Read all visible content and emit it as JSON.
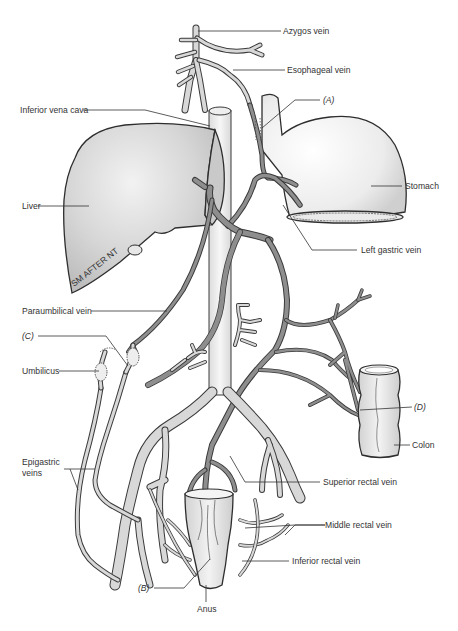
{
  "diagram": {
    "labels": {
      "azygos_vein": "Azygos vein",
      "esophageal_vein": "Esophageal vein",
      "inferior_vena_cava": "Inferior vena cava",
      "a": "(A)",
      "liver": "Liver",
      "stomach": "Stomach",
      "left_gastric_vein": "Left gastric vein",
      "paraumbilical_vein": "Paraumbilical vein",
      "c": "(C)",
      "umbilicus": "Umbilicus",
      "d": "(D)",
      "colon": "Colon",
      "epigastric_veins_line1": "Epigastric",
      "epigastric_veins_line2": "veins",
      "superior_rectal_vein": "Superior rectal vein",
      "middle_rectal_vein": "Middle rectal vein",
      "inferior_rectal_vein": "Inferior rectal vein",
      "b": "(B)",
      "anus": "Anus",
      "artist_signature": "SM AFTER NT"
    },
    "colors": {
      "portal_vein": "#8e8e8e",
      "systemic_vein": "#d8d8d8",
      "organ_fill": "#e6e6e6",
      "outline": "#2e2e2e",
      "label_text": "#333333"
    }
  }
}
